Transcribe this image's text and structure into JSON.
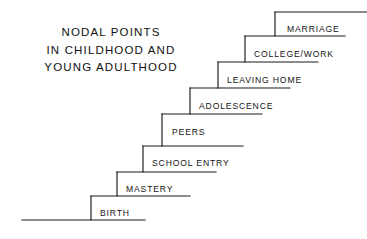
{
  "figure": {
    "name": "nodal-points-staircase-diagram",
    "background_color": "#ffffff",
    "line_color": "#1a1a1a",
    "text_color": "#141414"
  },
  "title": {
    "lines": [
      "NODAL POINTS",
      "IN CHILDHOOD AND",
      "YOUNG ADULTHOOD"
    ]
  },
  "chart_data": {
    "type": "diagram",
    "subtype": "ascending-staircase",
    "title": "NODAL POINTS IN CHILDHOOD AND YOUNG ADULTHOOD",
    "direction": "ascending left-to-right",
    "step_count": 8,
    "categories": [
      "BIRTH",
      "MASTERY",
      "SCHOOL ENTRY",
      "PEERS",
      "ADOLESCENCE",
      "LEAVING HOME",
      "COLLEGE/WORK",
      "MARRIAGE"
    ],
    "values": [
      1,
      2,
      3,
      4,
      5,
      6,
      7,
      8
    ],
    "xlabel": "",
    "ylabel": "",
    "legend": "none",
    "grid": false
  },
  "steps": [
    {
      "label": "BIRTH",
      "order": 1,
      "riser_x": 91,
      "tread_y": 196,
      "tread_right": 190,
      "label_x": 100,
      "label_y": 209
    },
    {
      "label": "MASTERY",
      "order": 2,
      "riser_x": 117,
      "tread_y": 172,
      "tread_right": 216,
      "label_x": 126,
      "label_y": 185
    },
    {
      "label": "SCHOOL ENTRY",
      "order": 3,
      "riser_x": 143,
      "tread_y": 146,
      "tread_right": 243,
      "label_x": 152,
      "label_y": 159
    },
    {
      "label": "PEERS",
      "order": 4,
      "riser_x": 162,
      "tread_y": 114,
      "tread_right": 262,
      "label_x": 172,
      "label_y": 128
    },
    {
      "label": "ADOLESCENCE",
      "order": 5,
      "riser_x": 190,
      "tread_y": 88,
      "tread_right": 290,
      "label_x": 199,
      "label_y": 102
    },
    {
      "label": "LEAVING HOME",
      "order": 6,
      "riser_x": 218,
      "tread_y": 62,
      "tread_right": 318,
      "label_x": 227,
      "label_y": 76
    },
    {
      "label": "COLLEGE/WORK",
      "order": 7,
      "riser_x": 245,
      "tread_y": 36,
      "tread_right": 345,
      "label_x": 254,
      "label_y": 50
    },
    {
      "label": "MARRIAGE",
      "order": 8,
      "riser_x": 275,
      "tread_y": 12,
      "tread_right": 367,
      "label_x": 287,
      "label_y": 25
    }
  ],
  "baseline": {
    "x1": 22,
    "x2": 145,
    "y": 220
  }
}
